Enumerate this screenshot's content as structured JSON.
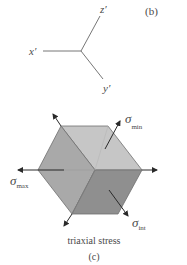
{
  "panel_b": {
    "label": "(b)",
    "axes": {
      "x": "x′",
      "y": "y′",
      "z": "z′"
    }
  },
  "panel_c": {
    "label": "(c)",
    "caption": "triaxial stress",
    "stresses": {
      "max": {
        "symbol": "σ",
        "subscript": "max"
      },
      "min": {
        "symbol": "σ",
        "subscript": "min"
      },
      "int": {
        "symbol": "σ",
        "subscript": "int"
      }
    },
    "colors": {
      "face_top": "#c6c6c6",
      "face_left": "#a9a9a9",
      "face_bottom": "#8f8f8f",
      "edge": "#6e6e6e",
      "arrow": "#2a2a2a",
      "axis_line": "#777777"
    }
  }
}
